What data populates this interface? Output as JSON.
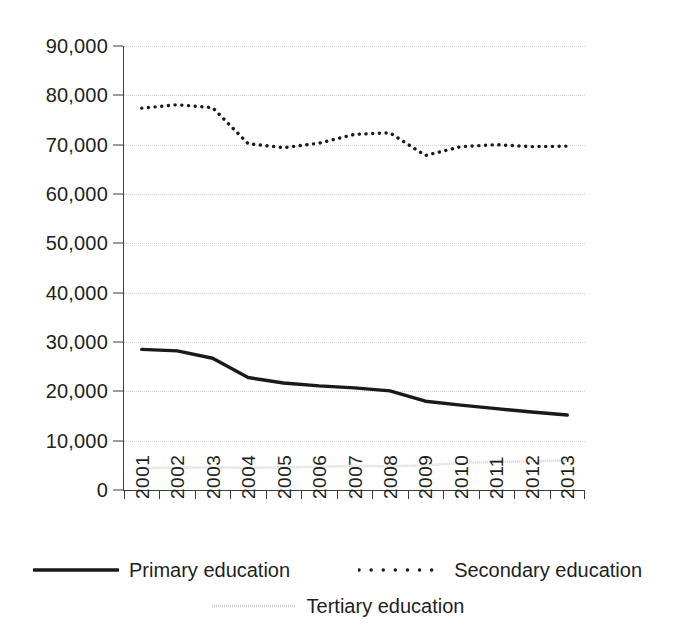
{
  "chart_data": {
    "type": "line",
    "title": "",
    "subtitle": "",
    "xlabel": "",
    "ylabel": "",
    "categories": [
      "2001",
      "2002",
      "2003",
      "2004",
      "2005",
      "2006",
      "2007",
      "2008",
      "2009",
      "2010",
      "2011",
      "2012",
      "2013"
    ],
    "ylim": [
      0,
      90000
    ],
    "y_ticks": [
      0,
      10000,
      20000,
      30000,
      40000,
      50000,
      60000,
      70000,
      80000,
      90000
    ],
    "y_tick_labels": [
      "0",
      "10,000",
      "20,000",
      "30,000",
      "40,000",
      "50,000",
      "60,000",
      "70,000",
      "80,000",
      "90,000"
    ],
    "grid": true,
    "grid_axis": "y",
    "legend_position": "bottom",
    "series": [
      {
        "name": "Primary education",
        "style": "solid",
        "color": "#1a1a1a",
        "values": [
          28500,
          28200,
          26700,
          22800,
          21700,
          21100,
          20700,
          20100,
          18000,
          17200,
          16500,
          15800,
          15200
        ]
      },
      {
        "name": "Secondary education",
        "style": "dotted",
        "color": "#1a1a1a",
        "values": [
          77400,
          78100,
          77500,
          70200,
          69400,
          70300,
          72100,
          72400,
          67800,
          69600,
          70000,
          69600,
          69700
        ]
      },
      {
        "name": "Tertiary education",
        "style": "fine-dotted",
        "color": "#b3b3b3",
        "values": [
          4500,
          4500,
          4600,
          4500,
          4600,
          4700,
          4900,
          4800,
          5000,
          5500,
          5700,
          5800,
          6000
        ]
      }
    ]
  },
  "legend": {
    "items": [
      {
        "label": "Primary education",
        "swatch": "solid-line-swatch"
      },
      {
        "label": "Secondary education",
        "swatch": "dotted-line-swatch"
      },
      {
        "label": "Tertiary education",
        "swatch": "fine-dotted-line-swatch"
      }
    ]
  }
}
